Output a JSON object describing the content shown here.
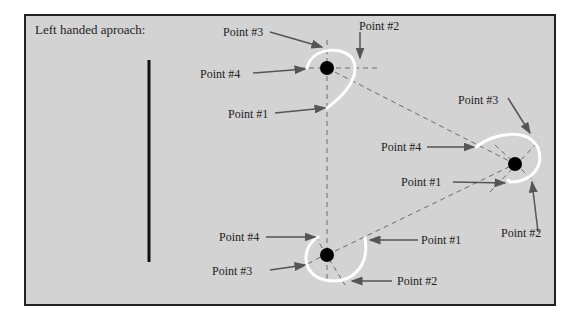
{
  "title": "Left handed aproach:",
  "colors": {
    "background": "#d3d3d3",
    "frame": "#222222",
    "path": "#ffffff",
    "guide": "#666666",
    "arrow": "#555555",
    "node": "#000000"
  },
  "nodes": [
    {
      "id": "top",
      "labels": {
        "p1": "Point #1",
        "p2": "Point #2",
        "p3": "Point #3",
        "p4": "Point #4"
      }
    },
    {
      "id": "right",
      "labels": {
        "p1": "Point #1",
        "p2": "Point #2",
        "p3": "Point #3",
        "p4": "Point #4"
      }
    },
    {
      "id": "bottom",
      "labels": {
        "p1": "Point #1",
        "p2": "Point #2",
        "p3": "Point #3",
        "p4": "Point #4"
      }
    }
  ]
}
